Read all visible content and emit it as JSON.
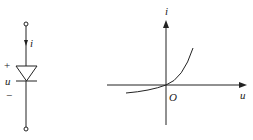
{
  "diagram": {
    "type": "circuit-and-characteristic",
    "colors": {
      "ink": "#222222",
      "background": "#ffffff"
    },
    "circuit": {
      "element": "diode",
      "current_label": "i",
      "voltage_label": "u",
      "plus_sign": "+",
      "minus_sign": "−"
    },
    "characteristic": {
      "x_axis_label": "u",
      "y_axis_label": "i",
      "origin_label": "O"
    }
  }
}
